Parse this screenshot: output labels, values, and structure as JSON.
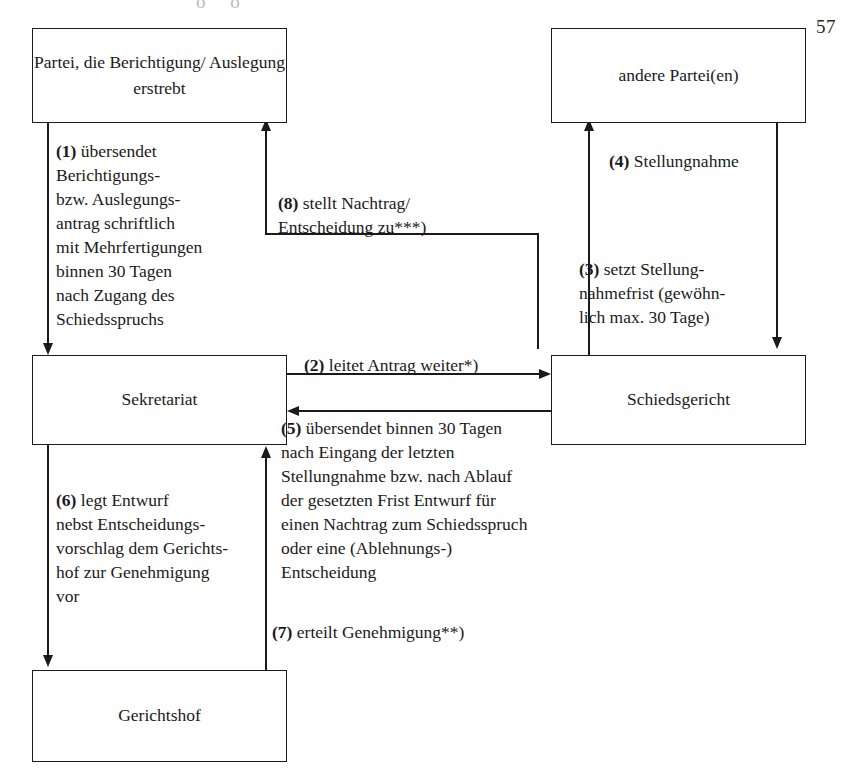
{
  "page": {
    "number": "57",
    "scan_artifact": "o o"
  },
  "nodes": {
    "party": "Partei, die Berichtigung/\nAuslegung erstrebt",
    "other_party": "andere Partei(en)",
    "secretariat": "Sekretariat",
    "tribunal": "Schiedsgericht",
    "court": "Gerichtshof"
  },
  "edges": {
    "step1": {
      "number": "(1)",
      "text": " übersendet\nBerichtigungs-\nbzw. Auslegungs-\nantrag schriftlich\nmit Mehrfertigungen\nbinnen 30 Tagen\nnach Zugang des\nSchiedsspruchs",
      "from": "party",
      "to": "secretariat"
    },
    "step2": {
      "number": "(2)",
      "text": " leitet Antrag weiter*)",
      "from": "secretariat",
      "to": "tribunal"
    },
    "step3": {
      "number": "(3)",
      "text": " setzt Stellung-\nnahmefrist (gewöhn-\nlich max. 30 Tage)",
      "from": "tribunal",
      "to": "other_party"
    },
    "step4": {
      "number": "(4)",
      "text": " Stellungnahme",
      "from": "other_party",
      "to": "tribunal"
    },
    "step5": {
      "number": "(5)",
      "text": " übersendet binnen 30 Tagen\nnach Eingang der letzten\nStellungnahme bzw. nach Ablauf\nder gesetzten Frist Entwurf für\neinen Nachtrag zum Schiedsspruch\noder eine (Ablehnungs-)\nEntscheidung",
      "from": "tribunal",
      "to": "secretariat"
    },
    "step6": {
      "number": "(6)",
      "text": " legt Entwurf\nnebst Entscheidungs-\nvorschlag dem Gerichts-\nhof zur Genehmigung\nvor",
      "from": "secretariat",
      "to": "court"
    },
    "step7": {
      "number": "(7)",
      "text": " erteilt Genehmigung**)",
      "from": "court",
      "to": "secretariat"
    },
    "step8": {
      "number": "(8)",
      "text": " stellt Nachtrag/\nEntscheidung zu***)",
      "from": "secretariat",
      "to": "party"
    }
  },
  "colors": {
    "line": "#1a1a1a",
    "background": "#ffffff"
  }
}
